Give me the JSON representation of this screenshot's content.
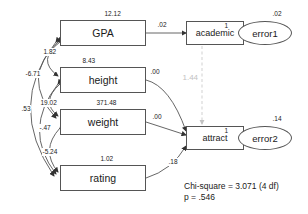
{
  "diagram": {
    "observed_nodes": [
      {
        "id": "gpa",
        "label": "GPA",
        "variance": "12.12"
      },
      {
        "id": "height",
        "label": "height",
        "variance": "8.43"
      },
      {
        "id": "weight",
        "label": "weight",
        "variance": "371.48"
      },
      {
        "id": "rating",
        "label": "rating",
        "variance": "1.02"
      }
    ],
    "latent_nodes": [
      {
        "id": "academic",
        "label": "academic"
      },
      {
        "id": "attract",
        "label": "attract"
      }
    ],
    "error_nodes": [
      {
        "id": "error1",
        "label": "error1",
        "variance": ".02",
        "loading": "1"
      },
      {
        "id": "error2",
        "label": "error2",
        "variance": ".14",
        "loading": "1"
      }
    ],
    "path_labels": {
      "gpa_to_academic": ".02",
      "height_to_attract": ".00",
      "weight_to_attract": ".00",
      "rating_to_attract": ".18",
      "academic_to_attract": "1.44"
    },
    "covariance_labels": {
      "gpa_height": "1.82",
      "gpa_weight": "-6.71",
      "height_weight": "19.02",
      "gpa_rating": ".53",
      "height_rating": "-.47",
      "weight_rating": "-5.24"
    },
    "fit_statistics": {
      "line1": "Chi-square = 3.071 (4 df)",
      "line2": "p = .546"
    },
    "colors": {
      "stroke": "#555555",
      "text": "#1a1a1a",
      "faded": "#c2c2c2",
      "background": "#ffffff"
    }
  }
}
